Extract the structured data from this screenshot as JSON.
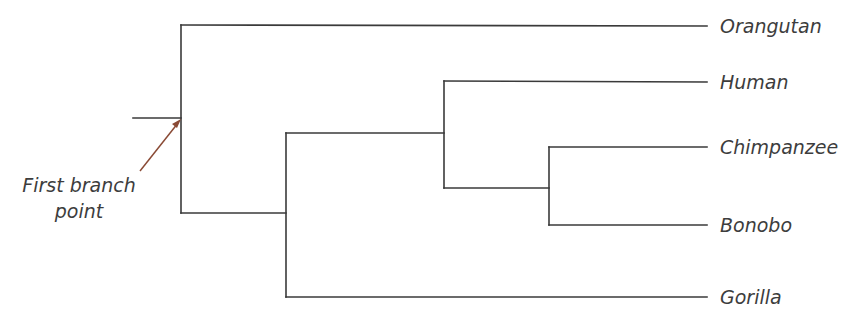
{
  "diagram": {
    "type": "phylogenetic-tree",
    "taxa": [
      "Orangutan",
      "Human",
      "Chimpanzee",
      "Bonobo",
      "Gorilla"
    ],
    "newick": "(Orangutan,((Human,(Chimpanzee,Bonobo)),Gorilla));",
    "annotation": {
      "text_line1": "First branch",
      "text_line2": "point",
      "target": "root node",
      "arrow_color": "#8a4a35"
    },
    "line_color": "#3a3a3a",
    "text_color": "#3d3d3d"
  }
}
